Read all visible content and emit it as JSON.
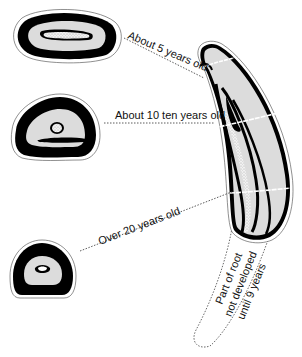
{
  "diagram": {
    "title": "",
    "labels": {
      "age5": "About 5 years old",
      "age10": "About 10 ten years old",
      "age20": "Over 20 years old",
      "root_line1": "Part of root",
      "root_line2": "not developed",
      "root_line3": "until 9 years"
    },
    "cross_sections": [
      {
        "name": "cross-section-5-years",
        "age_label": "About 5 years old"
      },
      {
        "name": "cross-section-10-years",
        "age_label": "About 10 ten years old"
      },
      {
        "name": "cross-section-20-years",
        "age_label": "Over 20 years old"
      }
    ],
    "colors": {
      "outline": "#000000",
      "dentine": "#dcdcdc",
      "pulp": "#ffffff",
      "background": "#ffffff"
    }
  }
}
